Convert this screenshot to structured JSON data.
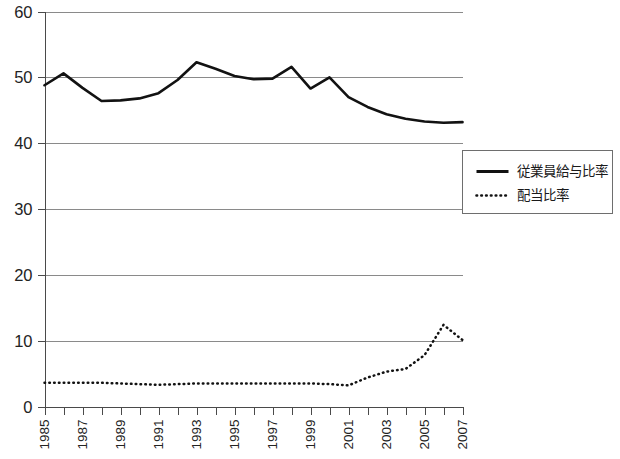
{
  "chart_data": {
    "type": "line",
    "title": "",
    "subtitle": "",
    "xlabel": "",
    "ylabel": "",
    "xlim": [
      1985,
      2007
    ],
    "ylim": [
      0,
      60
    ],
    "yticks": [
      0,
      10,
      20,
      30,
      40,
      50,
      60
    ],
    "ytick_labels": [
      "0",
      "10",
      "20",
      "30",
      "40",
      "50",
      "60"
    ],
    "x": [
      1985,
      1986,
      1987,
      1988,
      1989,
      1990,
      1991,
      1992,
      1993,
      1994,
      1995,
      1996,
      1997,
      1998,
      1999,
      2000,
      2001,
      2002,
      2003,
      2004,
      2005,
      2006,
      2007
    ],
    "xtick_labels": [
      "1985",
      "",
      "1987",
      "",
      "1989",
      "",
      "1991",
      "",
      "1993",
      "",
      "1995",
      "",
      "1997",
      "",
      "1999",
      "",
      "2001",
      "",
      "2003",
      "",
      "2005",
      "",
      "2007"
    ],
    "xtick_labels_shown": [
      "1985",
      "1987",
      "1989",
      "1991",
      "1993",
      "1995",
      "1997",
      "1999",
      "2001",
      "2003",
      "2005",
      "2007"
    ],
    "grid": true,
    "grid_axis": "y",
    "legend_position": "right",
    "series": [
      {
        "name": "従業員給与比率",
        "style": "solid",
        "color": "#121212",
        "values": [
          48.8,
          50.6,
          48.4,
          46.4,
          46.5,
          46.8,
          47.6,
          49.6,
          52.3,
          51.3,
          50.2,
          49.7,
          49.8,
          51.6,
          48.3,
          50.0,
          47.0,
          45.5,
          44.4,
          43.7,
          43.3,
          43.1,
          43.2
        ]
      },
      {
        "name": "配当比率",
        "style": "dotted",
        "color": "#121212",
        "values": [
          3.6,
          3.6,
          3.6,
          3.6,
          3.5,
          3.4,
          3.3,
          3.4,
          3.5,
          3.5,
          3.5,
          3.5,
          3.5,
          3.5,
          3.5,
          3.4,
          3.2,
          4.4,
          5.3,
          5.7,
          7.8,
          12.4,
          10.1
        ]
      }
    ]
  },
  "legend": {
    "entries": [
      {
        "label": "従業員給与比率",
        "style": "solid"
      },
      {
        "label": "配当比率",
        "style": "dotted"
      }
    ]
  }
}
